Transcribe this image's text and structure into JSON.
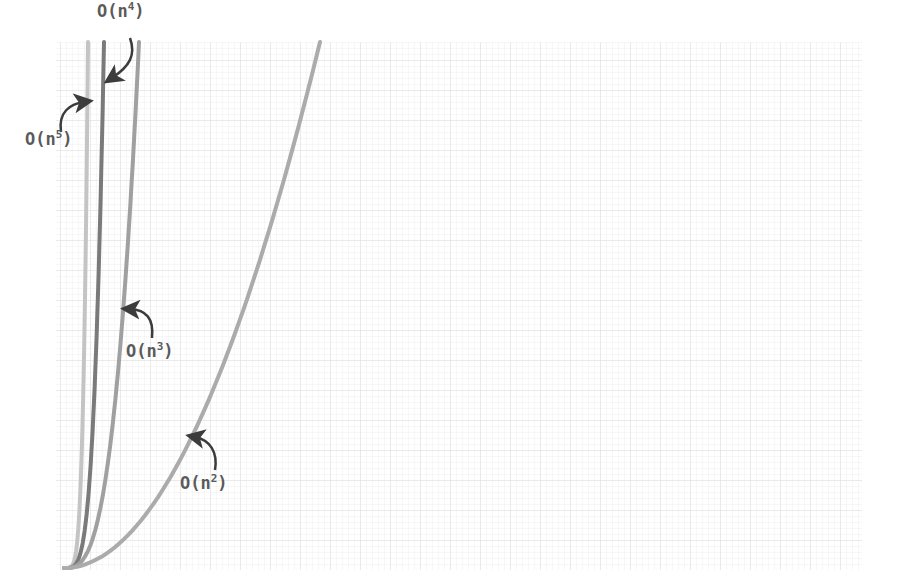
{
  "chart_data": {
    "type": "line",
    "title": "",
    "xlabel": "",
    "ylabel": "",
    "grid": true,
    "legend": "inline annotations with arrows",
    "x": [
      0,
      1,
      2,
      3,
      4,
      5,
      6,
      7,
      8,
      9,
      10
    ],
    "series": [
      {
        "name": "O(n^5)",
        "label_base": "O(n",
        "label_exp": "5",
        "label_close": ")",
        "color": "#c4c4c4",
        "exponent": 5,
        "top_x_px": 88
      },
      {
        "name": "O(n^4)",
        "label_base": "O(n",
        "label_exp": "4",
        "label_close": ")",
        "color": "#7a7a7a",
        "exponent": 4,
        "top_x_px": 104
      },
      {
        "name": "O(n^3)",
        "label_base": "O(n",
        "label_exp": "3",
        "label_close": ")",
        "color": "#a0a0a0",
        "exponent": 3,
        "top_x_px": 139
      },
      {
        "name": "O(n^2)",
        "label_base": "O(n",
        "label_exp": "2",
        "label_close": ")",
        "color": "#ababab",
        "exponent": 2,
        "top_x_px": 320
      }
    ],
    "annotations": [
      {
        "text": "O(n⁴)",
        "target": "O(n^4)"
      },
      {
        "text": "O(n⁵)",
        "target": "O(n^5)"
      },
      {
        "text": "O(n³)",
        "target": "O(n^3)"
      },
      {
        "text": "O(n²)",
        "target": "O(n^2)"
      }
    ],
    "plot_area_px": {
      "left": 56,
      "top": 42,
      "right": 862,
      "bottom": 570
    },
    "origin_px": [
      64,
      568
    ]
  },
  "colors": {
    "background": "#ffffff",
    "grid_minor": "#ececec",
    "grid_major": "#dcdcdc",
    "label": "#5a5a5a",
    "arrow": "#3c3c3c"
  }
}
